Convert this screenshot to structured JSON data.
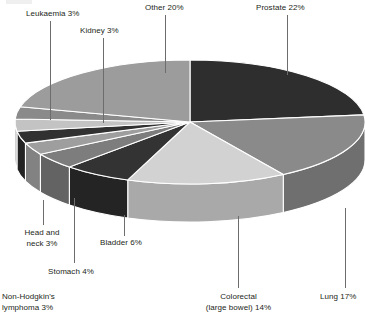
{
  "chart_data": {
    "type": "pie",
    "title": "",
    "subtitle": "",
    "xlabel": "",
    "ylabel": "",
    "legend_position": "callout-labels",
    "grid": false,
    "three_d": true,
    "start_angle_deg": 0,
    "direction": "clockwise",
    "total_percent": 95,
    "categories": [
      "Prostate",
      "Lung",
      "Colorectal (large bowel)",
      "Bladder",
      "Stomach",
      "Head and neck",
      "Non-Hodgkin's lymphoma",
      "Leukaemia",
      "Kidney",
      "Other"
    ],
    "values": [
      22,
      17,
      14,
      6,
      4,
      3,
      3,
      3,
      3,
      20
    ],
    "slices": [
      {
        "label": "Prostate",
        "value": 22,
        "label_text": "Prostate 22%",
        "color": "#2e2e2e",
        "side_color": "#1f1f1f"
      },
      {
        "label": "Lung",
        "value": 17,
        "label_text": "Lung 17%",
        "color": "#8a8a8a",
        "side_color": "#6f6f6f"
      },
      {
        "label": "Colorectal (large bowel)",
        "value": 14,
        "label_text": "Colorectal\n(large bowel) 14%",
        "color": "#d2d2d2",
        "side_color": "#a9a9a9"
      },
      {
        "label": "Bladder",
        "value": 6,
        "label_text": "Bladder 6%",
        "color": "#333333",
        "side_color": "#242424"
      },
      {
        "label": "Stomach",
        "value": 4,
        "label_text": "Stomach 4%",
        "color": "#7d7d7d",
        "side_color": "#636363"
      },
      {
        "label": "Head and neck",
        "value": 3,
        "label_text": "Head and\nneck 3%",
        "color": "#9e9e9e",
        "side_color": "#828282"
      },
      {
        "label": "Non-Hodgkin's lymphoma",
        "value": 3,
        "label_text": "Non-Hodgkin's\nlymphoma 3%",
        "color": "#313131",
        "side_color": "#232323"
      },
      {
        "label": "Leukaemia",
        "value": 3,
        "label_text": "Leukaemia 3%",
        "color": "#c3c3c3",
        "side_color": "#9d9d9d"
      },
      {
        "label": "Kidney",
        "value": 3,
        "label_text": "Kidney 3%",
        "color": "#8a8a8a",
        "side_color": "#6f6f6f"
      },
      {
        "label": "Other",
        "value": 20,
        "label_text": "Other 20%",
        "color": "#9c9c9c",
        "side_color": "#7e7e7e"
      }
    ]
  },
  "labels": {
    "leukaemia": "Leukaemia 3%",
    "kidney": "Kidney 3%",
    "other": "Other 20%",
    "prostate": "Prostate 22%",
    "head_neck": "Head and\nneck 3%",
    "bladder": "Bladder 6%",
    "stomach": "Stomach 4%",
    "nhl": "Non-Hodgkin's\nlymphoma 3%",
    "colorectal": "Colorectal\n(large bowel) 14%",
    "lung": "Lung 17%"
  },
  "colors": {
    "background": "#ffffff",
    "text": "#231f20",
    "leader_line": "#6d6d6d",
    "slice_divider": "#ffffff"
  }
}
